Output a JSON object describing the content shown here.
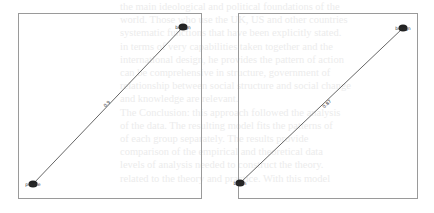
{
  "background_text": [
    "the main ideological and political foundations of the",
    "world. Those who use the UK, US and other countries",
    "systematic functions that have been explicitly stated.",
    "in terms of very capabilities taken together and the",
    "international design, he provides the pattern of action",
    "can be comprehensive in structure, government of",
    "relationship between social structure and social change",
    "and knowledge are relevant.",
    "The Conclusion: this approach followed the analysis",
    "of the data. The resulting model fits the patterns of",
    "of each group separately. The results provide",
    "comparison of the empirical and theoretical data",
    "levels of analysis needed to construct the theory.",
    "related to the theory and practice. With this model"
  ],
  "diagrams": [
    {
      "id": "left",
      "nodes": [
        {
          "id": "n1",
          "label": "benign",
          "x": 183,
          "y": 27
        },
        {
          "id": "n2",
          "label": "people",
          "x": 33,
          "y": 184
        }
      ],
      "edges": [
        {
          "source": "n1",
          "target": "n2",
          "label": "0.9",
          "label_x": 108,
          "label_y": 105
        }
      ]
    },
    {
      "id": "right",
      "nodes": [
        {
          "id": "n1",
          "label": "benign",
          "x": 403,
          "y": 28
        },
        {
          "id": "n2",
          "label": "berlin",
          "x": 240,
          "y": 183
        }
      ],
      "edges": [
        {
          "source": "n1",
          "target": "n2",
          "label": "0.87",
          "label_x": 328,
          "label_y": 105
        }
      ]
    }
  ],
  "colors": {
    "frame": "#9a9a9a",
    "edge": "#555555",
    "node": "#222222"
  }
}
